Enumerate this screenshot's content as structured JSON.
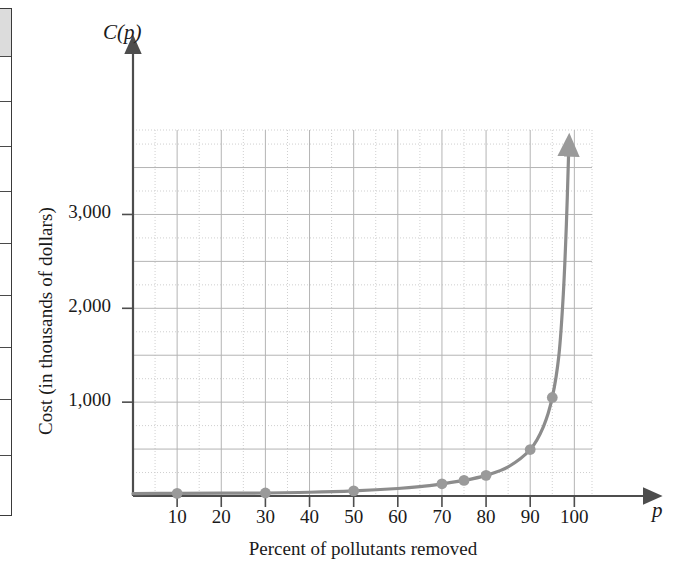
{
  "figure": {
    "axis_name_y": "C(p)",
    "axis_name_x": "p",
    "axis_title_y": "Cost (in thousands of dollars)",
    "axis_title_x": "Percent of pollutants removed"
  },
  "colors": {
    "curve": "#8c8c8c",
    "marker": "#9a9a9a",
    "axis": "#4d4d4d",
    "grid_major": "#b4b4b4",
    "grid_minor": "#cfcfcf",
    "text": "#1a1a1a",
    "edge_shade": "#dcdcdc"
  },
  "chart_data": {
    "type": "line",
    "title": "",
    "subtitle": "",
    "xlabel": "Percent of pollutants removed",
    "ylabel": "Cost (in thousands of dollars)",
    "x_axis_symbol": "p",
    "y_axis_symbol": "C(p)",
    "xlim": [
      0,
      104
    ],
    "ylim": [
      0,
      3900
    ],
    "grid": true,
    "grid_major_x_step": 10,
    "grid_major_y_step": 500,
    "grid_minor_x_step": 5,
    "grid_minor_y_step": 250,
    "legend": "none",
    "xticks": [
      10,
      20,
      30,
      40,
      50,
      60,
      70,
      80,
      90,
      100
    ],
    "xtick_labels": [
      "10",
      "20",
      "30",
      "40",
      "50",
      "60",
      "70",
      "80",
      "90",
      "100"
    ],
    "yticks": [
      1000,
      2000,
      3000
    ],
    "ytick_labels": [
      "1,000",
      "2,000",
      "3,000"
    ],
    "series": [
      {
        "name": "C(p)",
        "marker": "circle",
        "points": [
          {
            "x": 10,
            "y": 28
          },
          {
            "x": 30,
            "y": 32
          },
          {
            "x": 50,
            "y": 55
          },
          {
            "x": 70,
            "y": 130
          },
          {
            "x": 75,
            "y": 166
          },
          {
            "x": 80,
            "y": 220
          },
          {
            "x": 90,
            "y": 495
          },
          {
            "x": 95,
            "y": 1050
          }
        ],
        "curve": [
          {
            "x": 0,
            "y": 25
          },
          {
            "x": 10,
            "y": 28
          },
          {
            "x": 20,
            "y": 30
          },
          {
            "x": 30,
            "y": 32
          },
          {
            "x": 40,
            "y": 40
          },
          {
            "x": 50,
            "y": 55
          },
          {
            "x": 60,
            "y": 80
          },
          {
            "x": 65,
            "y": 100
          },
          {
            "x": 70,
            "y": 130
          },
          {
            "x": 75,
            "y": 166
          },
          {
            "x": 80,
            "y": 220
          },
          {
            "x": 85,
            "y": 310
          },
          {
            "x": 90,
            "y": 495
          },
          {
            "x": 93,
            "y": 740
          },
          {
            "x": 95,
            "y": 1050
          },
          {
            "x": 96.5,
            "y": 1500
          },
          {
            "x": 97.5,
            "y": 2150
          },
          {
            "x": 98.2,
            "y": 2900
          },
          {
            "x": 98.7,
            "y": 3650
          }
        ],
        "asymptote_note": "vertical asymptote near p = 100; curve rises off chart with arrowhead"
      }
    ]
  },
  "page_edge_table": {
    "rows": [
      {
        "shaded": true,
        "height": 48
      },
      {
        "shaded": false,
        "height": 45
      },
      {
        "shaded": false,
        "height": 45
      },
      {
        "shaded": false,
        "height": 45
      },
      {
        "shaded": false,
        "height": 52
      },
      {
        "shaded": false,
        "height": 52
      },
      {
        "shaded": false,
        "height": 52
      },
      {
        "shaded": false,
        "height": 52
      },
      {
        "shaded": false,
        "height": 56
      },
      {
        "shaded": false,
        "height": 58
      }
    ]
  }
}
